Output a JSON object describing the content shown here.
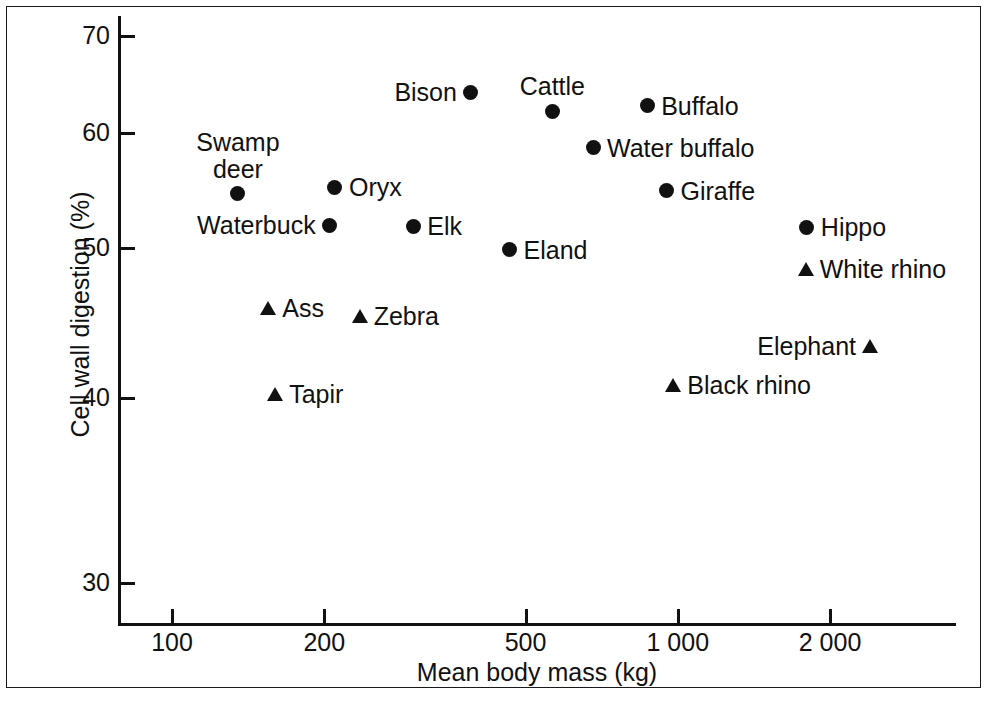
{
  "chart_data": {
    "type": "scatter",
    "title": "",
    "xlabel": "Mean body mass (kg)",
    "ylabel": "Cell wall digestion (%)",
    "x_scale": "log",
    "y_scale": "linear",
    "xlim": [
      78,
      2900
    ],
    "ylim": [
      27.5,
      71.5
    ],
    "grid": false,
    "legend": "none",
    "x_ticks": [
      {
        "value": 100,
        "label": "100"
      },
      {
        "value": 200,
        "label": "200"
      },
      {
        "value": 500,
        "label": "500"
      },
      {
        "value": 1000,
        "label": "1 000"
      },
      {
        "value": 2000,
        "label": "2 000"
      }
    ],
    "y_ticks": [
      {
        "value": 70,
        "label": "70"
      },
      {
        "value": 60,
        "label": "60"
      },
      {
        "value": 50,
        "label": "50"
      },
      {
        "value": 40,
        "label": "40"
      },
      {
        "value": 30,
        "label": "30"
      }
    ],
    "marker_types": {
      "circle": "ruminant",
      "triangle": "non-ruminant"
    },
    "points": [
      {
        "label": "Bison",
        "x": 390,
        "y": 64.2,
        "marker": "circle",
        "label_pos": "left"
      },
      {
        "label": "Cattle",
        "x": 565,
        "y": 62.2,
        "marker": "circle",
        "label_pos": "above"
      },
      {
        "label": "Buffalo",
        "x": 870,
        "y": 62.8,
        "marker": "circle",
        "label_pos": "right"
      },
      {
        "label": "Water buffalo",
        "x": 680,
        "y": 58.7,
        "marker": "circle",
        "label_pos": "right"
      },
      {
        "label": "Swamp\ndeer",
        "x": 135,
        "y": 54.7,
        "marker": "circle",
        "label_pos": "above"
      },
      {
        "label": "Oryx",
        "x": 210,
        "y": 55.3,
        "marker": "circle",
        "label_pos": "right"
      },
      {
        "label": "Giraffe",
        "x": 950,
        "y": 55.0,
        "marker": "circle",
        "label_pos": "right"
      },
      {
        "label": "Waterbuck",
        "x": 205,
        "y": 52.0,
        "marker": "circle",
        "label_pos": "left"
      },
      {
        "label": "Elk",
        "x": 300,
        "y": 51.9,
        "marker": "circle",
        "label_pos": "right"
      },
      {
        "label": "Hippo",
        "x": 1800,
        "y": 51.8,
        "marker": "circle",
        "label_pos": "right"
      },
      {
        "label": "Eland",
        "x": 465,
        "y": 49.9,
        "marker": "circle",
        "label_pos": "right"
      },
      {
        "label": "White rhino",
        "x": 1790,
        "y": 48.6,
        "marker": "triangle",
        "label_pos": "right"
      },
      {
        "label": "Ass",
        "x": 155,
        "y": 46.0,
        "marker": "triangle",
        "label_pos": "right"
      },
      {
        "label": "Zebra",
        "x": 235,
        "y": 45.5,
        "marker": "triangle",
        "label_pos": "right"
      },
      {
        "label": "Elephant",
        "x": 2400,
        "y": 43.5,
        "marker": "triangle",
        "label_pos": "left"
      },
      {
        "label": "Black rhino",
        "x": 980,
        "y": 40.9,
        "marker": "triangle",
        "label_pos": "right"
      },
      {
        "label": "Tapir",
        "x": 160,
        "y": 40.3,
        "marker": "triangle",
        "label_pos": "right"
      }
    ],
    "colors": {
      "marker": "#111111",
      "axis": "#111111",
      "background": "#ffffff",
      "frame": "#1a1a1a"
    }
  }
}
